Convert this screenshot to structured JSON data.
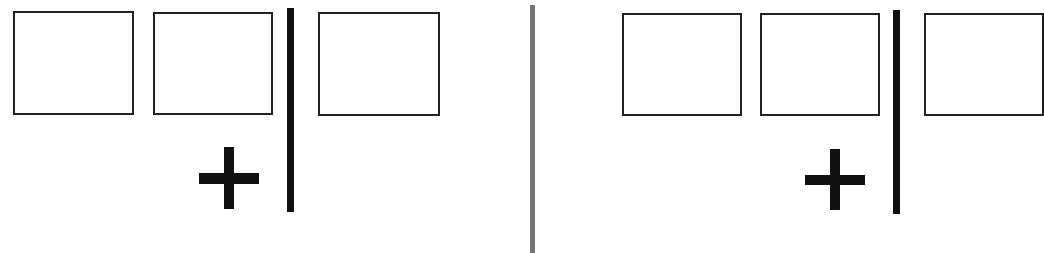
{
  "diagram": {
    "colors": {
      "box_border": "#222222",
      "bar": "#111111",
      "divider": "#777777",
      "background": "#ffffff"
    },
    "panels": [
      {
        "id": "left",
        "boxes": 3,
        "symbol": "plus"
      },
      {
        "id": "right",
        "boxes": 3,
        "symbol": "plus",
        "third_box_cropped": true
      }
    ]
  }
}
